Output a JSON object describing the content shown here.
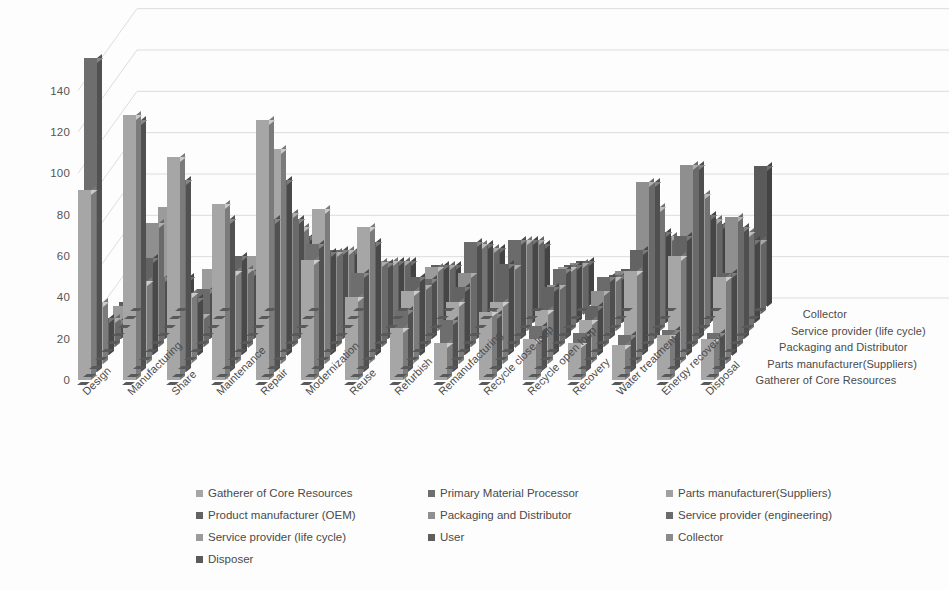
{
  "chart_data": {
    "type": "bar",
    "render": "3d-column",
    "title": "",
    "xlabel": "",
    "ylabel": "",
    "ylim": [
      0,
      150
    ],
    "yticks": [
      0,
      20,
      40,
      60,
      80,
      100,
      120,
      140
    ],
    "grid": true,
    "legend_position": "bottom",
    "categories": [
      "Design",
      "Manufacturing",
      "Share",
      "Maintenance",
      "Repair",
      "Modernization",
      "Reuse",
      "Refurbish",
      "Remanufacturing",
      "Recycle close loop",
      "Recycle open loop",
      "Recovery",
      "Water treatment",
      "Energy recovery",
      "Disposal"
    ],
    "depth_axis_labels": [
      "Gatherer of Core Resources",
      "Parts manufacturer(Suppliers)",
      "Packaging and Distributor",
      "Service provider (life cycle)",
      "Collector"
    ],
    "series": [
      {
        "name": "Gatherer of Core Resources",
        "color": "#a6a6a6",
        "values": [
          92,
          0,
          0,
          0,
          0,
          0,
          0,
          0,
          0,
          0,
          0,
          0,
          0,
          0,
          0
        ]
      },
      {
        "name": "Primary Material Processor",
        "color": "#6e6e6e",
        "values": [
          152,
          0,
          0,
          0,
          0,
          0,
          0,
          0,
          0,
          0,
          0,
          0,
          0,
          0,
          0
        ]
      },
      {
        "name": "Parts manufacturer(Suppliers)",
        "color": "#a6a6a6",
        "values": [
          128,
          30,
          0,
          0,
          0,
          0,
          0,
          0,
          0,
          0,
          0,
          0,
          0,
          0,
          0
        ]
      },
      {
        "name": "Product manufacturer (OEM)",
        "color": "#636363",
        "values": [
          122,
          0,
          0,
          0,
          0,
          0,
          0,
          0,
          0,
          0,
          0,
          0,
          0,
          0,
          0
        ]
      },
      {
        "name": "Packaging and Distributor",
        "color": "#8f8f8f",
        "values": [
          74,
          40,
          18,
          0,
          0,
          0,
          0,
          0,
          0,
          0,
          0,
          0,
          0,
          0,
          0
        ]
      },
      {
        "name": "Service provider (engineering)",
        "color": "#6b6b6b",
        "values": [
          78,
          47,
          0,
          0,
          0,
          0,
          0,
          0,
          0,
          0,
          0,
          0,
          0,
          0,
          0
        ]
      },
      {
        "name": "Service provider (life cycle)",
        "color": "#9b9b9b",
        "values": [
          85,
          60,
          28,
          0,
          0,
          0,
          0,
          0,
          0,
          0,
          0,
          0,
          0,
          0,
          0
        ]
      },
      {
        "name": "User",
        "color": "#5e5e5e",
        "values": [
          108,
          93,
          34,
          0,
          0,
          0,
          0,
          0,
          0,
          0,
          0,
          0,
          0,
          0,
          0
        ]
      },
      {
        "name": "Collector",
        "color": "#8a8a8a",
        "values": [
          63,
          30,
          0,
          0,
          0,
          0,
          0,
          0,
          0,
          0,
          0,
          0,
          0,
          0,
          0
        ]
      },
      {
        "name": "Disposer",
        "color": "#5a5a5a",
        "values": [
          126,
          60,
          9,
          0,
          0,
          0,
          0,
          0,
          0,
          0,
          0,
          0,
          0,
          0,
          0
        ]
      }
    ],
    "matrix_note": "values[row][col] = bar height for depth-row (series) x category",
    "matrix": [
      [
        92,
        128,
        108,
        85,
        126,
        58,
        40,
        25,
        18,
        33,
        20,
        18,
        17,
        22,
        20
      ],
      [
        152,
        122,
        93,
        74,
        74,
        62,
        48,
        30,
        25,
        28,
        22,
        19,
        18,
        20,
        19
      ],
      [
        30,
        40,
        34,
        45,
        104,
        75,
        66,
        35,
        30,
        30,
        26,
        21,
        45,
        52,
        42
      ],
      [
        18,
        47,
        28,
        48,
        85,
        50,
        55,
        38,
        33,
        44,
        33,
        24,
        51,
        58,
        40
      ],
      [
        14,
        60,
        16,
        38,
        65,
        46,
        41,
        30,
        36,
        40,
        30,
        27,
        80,
        88,
        63
      ],
      [
        9,
        30,
        24,
        33,
        58,
        43,
        37,
        29,
        47,
        48,
        34,
        30,
        76,
        84,
        54
      ],
      [
        12,
        60,
        30,
        36,
        50,
        39,
        34,
        31,
        42,
        44,
        31,
        26,
        60,
        66,
        48
      ],
      [
        10,
        22,
        19,
        27,
        42,
        35,
        30,
        28,
        38,
        40,
        28,
        23,
        44,
        52,
        40
      ],
      [
        8,
        18,
        15,
        22,
        36,
        30,
        26,
        24,
        32,
        36,
        25,
        21,
        38,
        46,
        36
      ],
      [
        6,
        14,
        12,
        18,
        30,
        26,
        22,
        20,
        28,
        30,
        22,
        18,
        32,
        40,
        68
      ]
    ],
    "axis_color": "#bfbfbf",
    "text_color": "#4a4a4a",
    "background": "#ffffff"
  },
  "legend": {
    "items": [
      {
        "label": "Gatherer of Core Resources",
        "color": "#a6a6a6"
      },
      {
        "label": "Primary Material Processor",
        "color": "#6e6e6e"
      },
      {
        "label": "Parts manufacturer(Suppliers)",
        "color": "#a0a0a0"
      },
      {
        "label": "Product manufacturer (OEM)",
        "color": "#636363"
      },
      {
        "label": "Packaging and Distributor",
        "color": "#8f8f8f"
      },
      {
        "label": "Service provider (engineering)",
        "color": "#6b6b6b"
      },
      {
        "label": "Service provider (life cycle)",
        "color": "#9b9b9b"
      },
      {
        "label": "User",
        "color": "#5e5e5e"
      },
      {
        "label": "Collector",
        "color": "#8a8a8a"
      },
      {
        "label": "Disposer",
        "color": "#5a5a5a"
      }
    ]
  }
}
